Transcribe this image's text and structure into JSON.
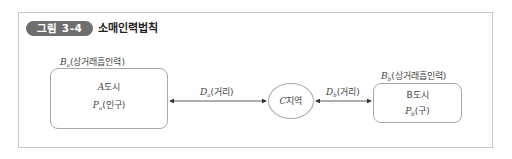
{
  "figure": {
    "badge": "그림 3-4",
    "title": "소매인력법칙"
  },
  "diagram": {
    "city_a": {
      "attraction_var": "B",
      "attraction_sub": "a",
      "attraction_label": "(상거래흡인력)",
      "name_var": "A",
      "name_label": "도시",
      "pop_var": "P",
      "pop_sub": "a",
      "pop_label": "(인구)"
    },
    "city_b": {
      "attraction_var": "B",
      "attraction_sub": "b",
      "attraction_label": "(상거래흡인력)",
      "name_var": "B",
      "name_label": "도시",
      "pop_var": "P",
      "pop_sub": "b",
      "pop_label": "(구)"
    },
    "region_c": {
      "name_var": "C",
      "name_label": "지역"
    },
    "distance_a": {
      "var": "D",
      "sub": "a",
      "label": "(거리)"
    },
    "distance_b": {
      "var": "D",
      "sub": "b",
      "label": "(거리)"
    }
  },
  "colors": {
    "badge_bg": "#6e6e6e",
    "frame_border": "#c9c9c9",
    "shape_border": "#a9a9a9",
    "arrow": "#333333"
  }
}
